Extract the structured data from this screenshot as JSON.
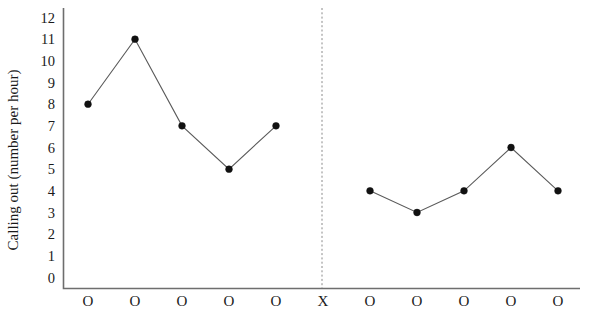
{
  "chart_data": {
    "type": "line",
    "title": "",
    "xlabel": "",
    "ylabel": "Calling out (number per hour)",
    "ylim": [
      0,
      12
    ],
    "yticks": [
      12,
      11,
      10,
      9,
      8,
      7,
      6,
      5,
      4,
      3,
      2,
      1,
      0
    ],
    "grid": false,
    "legend": "none",
    "x": [
      1,
      2,
      3,
      4,
      5,
      6,
      7,
      8,
      9,
      10,
      11
    ],
    "xticklabels": [
      "O",
      "O",
      "O",
      "O",
      "O",
      "X",
      "O",
      "O",
      "O",
      "O",
      "O"
    ],
    "series": [
      {
        "name": "Phase 1",
        "x": [
          1,
          2,
          3,
          4,
          5
        ],
        "values": [
          8,
          11,
          7,
          5,
          7
        ]
      },
      {
        "name": "Phase 2",
        "x": [
          7,
          8,
          9,
          10,
          11
        ],
        "values": [
          4,
          3,
          4,
          6,
          4
        ]
      }
    ],
    "annotations": [
      {
        "name": "phase-divider",
        "type": "vertical-dashed-line",
        "at_x": 6,
        "label": "X"
      }
    ]
  },
  "axes": {
    "y_axis_name": "y-axis",
    "x_axis_name": "x-axis"
  }
}
